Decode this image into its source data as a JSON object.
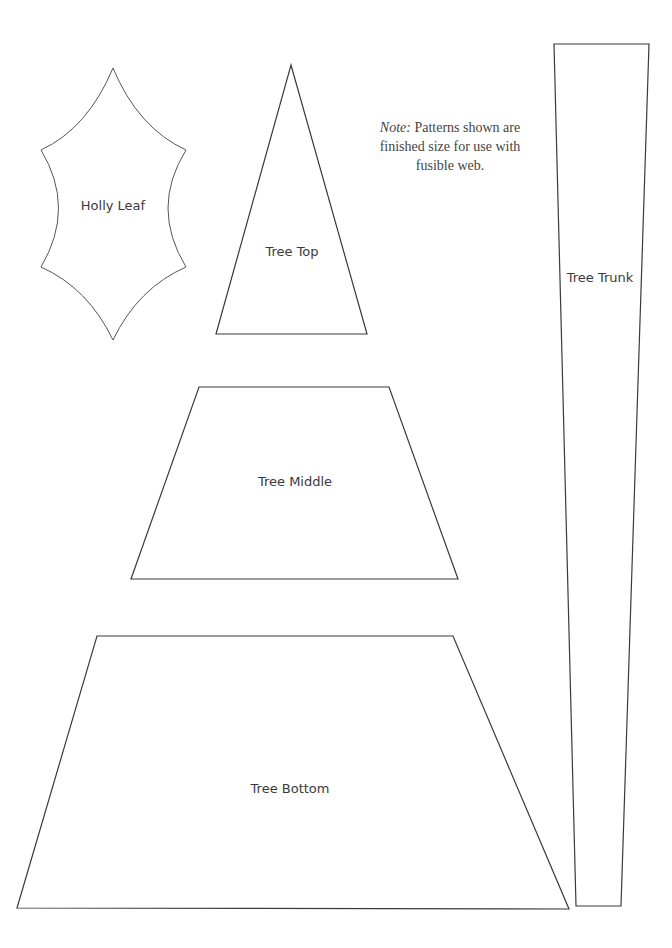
{
  "note": {
    "label": "Note:",
    "text": " Patterns shown are finished size for use with fusible web."
  },
  "patterns": {
    "holly_leaf": {
      "label": "Holly Leaf"
    },
    "tree_top": {
      "label": "Tree Top"
    },
    "tree_middle": {
      "label": "Tree Middle"
    },
    "tree_bottom": {
      "label": "Tree Bottom"
    },
    "tree_trunk": {
      "label": "Tree Trunk"
    }
  },
  "colors": {
    "outline": "#3a3a3a",
    "text": "#3a3a3a",
    "background": "#ffffff"
  }
}
